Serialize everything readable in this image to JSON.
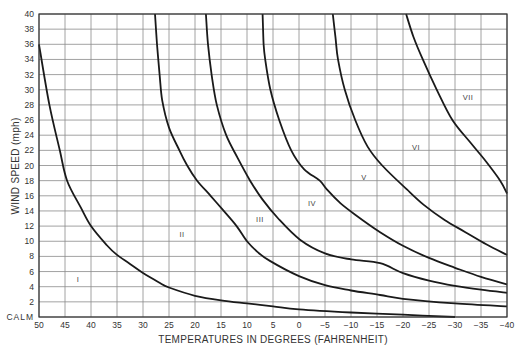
{
  "chart_data": {
    "type": "line",
    "title": "",
    "xlabel": "TEMPERATURES IN DEGREES (FAHRENHEIT)",
    "ylabel": "WIND SPEED (mph)",
    "xlim": [
      50,
      -40
    ],
    "ylim": [
      0,
      40
    ],
    "x_reversed": true,
    "grid": true,
    "legend": "none",
    "x_ticks": [
      50,
      45,
      40,
      35,
      30,
      25,
      20,
      15,
      10,
      5,
      0,
      -5,
      -10,
      -15,
      -20,
      -25,
      -30,
      -35,
      -40
    ],
    "x_tick_labels": [
      "50",
      "45",
      "40",
      "35",
      "30",
      "25",
      "20",
      "15",
      "10",
      "5",
      "0",
      "−5",
      "−10",
      "−15",
      "−20",
      "−25",
      "−30",
      "−35",
      "−40"
    ],
    "y_ticks": [
      0,
      2,
      4,
      6,
      8,
      10,
      12,
      14,
      16,
      18,
      20,
      22,
      24,
      26,
      28,
      30,
      32,
      34,
      36,
      38,
      40
    ],
    "y_tick_labels": [
      "CALM",
      "2",
      "4",
      "6",
      "8",
      "10",
      "12",
      "14",
      "16",
      "18",
      "20",
      "22",
      "24",
      "26",
      "28",
      "30",
      "32",
      "34",
      "36",
      "38",
      "40"
    ],
    "series": [
      {
        "name": "Boundary I/II",
        "points": [
          [
            50,
            36
          ],
          [
            48,
            28
          ],
          [
            46,
            22
          ],
          [
            44.6,
            18
          ],
          [
            42,
            14.5
          ],
          [
            40,
            12
          ],
          [
            37,
            9.5
          ],
          [
            35,
            8.2
          ],
          [
            32.5,
            7
          ],
          [
            30,
            5.8
          ],
          [
            27,
            4.6
          ],
          [
            25,
            3.9
          ],
          [
            20,
            2.8
          ],
          [
            15,
            2.2
          ],
          [
            10,
            1.8
          ],
          [
            5,
            1.4
          ],
          [
            0,
            1.0
          ],
          [
            -10,
            0.6
          ],
          [
            -20,
            0.3
          ],
          [
            -30,
            0
          ]
        ]
      },
      {
        "name": "Boundary II/III",
        "points": [
          [
            27.7,
            40
          ],
          [
            27.3,
            36
          ],
          [
            26.8,
            32
          ],
          [
            26.3,
            28.6
          ],
          [
            25,
            25
          ],
          [
            23,
            22
          ],
          [
            21.5,
            20
          ],
          [
            19.6,
            18
          ],
          [
            17,
            16
          ],
          [
            14.6,
            14.1
          ],
          [
            12,
            12
          ],
          [
            10,
            10
          ],
          [
            8,
            8.6
          ],
          [
            5.6,
            7.4
          ],
          [
            0,
            5.4
          ],
          [
            -5,
            4.2
          ],
          [
            -10,
            3.5
          ],
          [
            -15.6,
            2.9
          ],
          [
            -20,
            2.4
          ],
          [
            -30,
            1.8
          ],
          [
            -40,
            1.4
          ]
        ]
      },
      {
        "name": "Boundary III/IV",
        "points": [
          [
            17.9,
            40
          ],
          [
            17.5,
            36
          ],
          [
            16.8,
            32
          ],
          [
            15.8,
            28
          ],
          [
            14,
            24
          ],
          [
            11.8,
            21
          ],
          [
            9.4,
            18
          ],
          [
            7,
            15.5
          ],
          [
            4,
            13
          ],
          [
            -0.2,
            10.2
          ],
          [
            -5,
            8.4
          ],
          [
            -10,
            7.6
          ],
          [
            -15.6,
            7.1
          ],
          [
            -20,
            5.8
          ],
          [
            -25,
            4.8
          ],
          [
            -30,
            4.1
          ],
          [
            -35,
            3.6
          ],
          [
            -40,
            3.2
          ]
        ]
      },
      {
        "name": "Boundary IV/V",
        "points": [
          [
            7,
            40
          ],
          [
            6.8,
            36
          ],
          [
            6.5,
            34
          ],
          [
            5.5,
            30
          ],
          [
            3.8,
            26
          ],
          [
            1.5,
            22
          ],
          [
            -1,
            19.5
          ],
          [
            -4,
            18
          ],
          [
            -5.4,
            16.8
          ],
          [
            -8,
            15
          ],
          [
            -10.8,
            13.5
          ],
          [
            -15.6,
            11.2
          ],
          [
            -20,
            9.4
          ],
          [
            -25,
            7.8
          ],
          [
            -30,
            6.5
          ],
          [
            -35,
            5.3
          ],
          [
            -40,
            4.3
          ]
        ]
      },
      {
        "name": "Boundary V/VI",
        "points": [
          [
            -6.5,
            40
          ],
          [
            -7,
            37
          ],
          [
            -7.5,
            34
          ],
          [
            -8.8,
            30
          ],
          [
            -10.8,
            26
          ],
          [
            -13.2,
            22.5
          ],
          [
            -16,
            20
          ],
          [
            -20.8,
            16.8
          ],
          [
            -24,
            14.8
          ],
          [
            -28,
            12.8
          ],
          [
            -32,
            11.2
          ],
          [
            -36,
            9.6
          ],
          [
            -40,
            8.2
          ]
        ]
      },
      {
        "name": "Boundary VI/VII",
        "points": [
          [
            -20.6,
            40
          ],
          [
            -22,
            37
          ],
          [
            -23.8,
            34
          ],
          [
            -26.5,
            30
          ],
          [
            -29.5,
            26
          ],
          [
            -33,
            23
          ],
          [
            -36,
            20.5
          ],
          [
            -38.7,
            18
          ],
          [
            -40,
            16.3
          ]
        ]
      }
    ],
    "zones": [
      {
        "label": "I",
        "x": 42.5,
        "y": 5
      },
      {
        "label": "II",
        "x": 22.5,
        "y": 11
      },
      {
        "label": "III",
        "x": 7.5,
        "y": 13
      },
      {
        "label": "IV",
        "x": -2.5,
        "y": 15
      },
      {
        "label": "V",
        "x": -12.5,
        "y": 18.5
      },
      {
        "label": "VI",
        "x": -22.5,
        "y": 22.5
      },
      {
        "label": "VII",
        "x": -32.5,
        "y": 29
      }
    ]
  }
}
